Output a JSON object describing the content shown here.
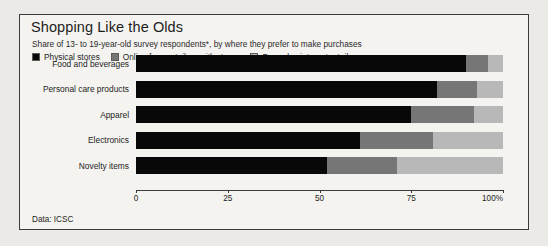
{
  "figure": {
    "title": "Shopping Like the Olds",
    "subtitle": "Share of 13- to 19-year-old survey respondents*, by where they prefer to make purchases",
    "source_note": "Data: ICSC",
    "colors": {
      "series_physical": "#080808",
      "series_online_retailers": "#767676",
      "series_pure_play": "#b8b8b8",
      "background": "#f4f3f0",
      "border": "#3a3a3a",
      "text": "#1d1d1d"
    }
  },
  "chart_data": {
    "type": "bar",
    "orientation": "horizontal",
    "stacked": true,
    "stack_total": 100,
    "title": "Shopping Like the Olds",
    "subtitle": "Share of 13- to 19-year-old survey respondents*, by where they prefer to make purchases",
    "xlabel": "",
    "ylabel": "",
    "xlim": [
      0,
      100
    ],
    "xticks": [
      0,
      25,
      50,
      75,
      100
    ],
    "xtick_labels": [
      "0",
      "25",
      "50",
      "75",
      "100%"
    ],
    "grid": false,
    "legend_position": "top-left",
    "categories": [
      "Food and beverages",
      "Personal care products",
      "Apparel",
      "Electronics",
      "Novelty items"
    ],
    "series": [
      {
        "name": "Physical stores",
        "color": "#080808",
        "values": [
          90,
          82,
          75,
          61,
          52
        ]
      },
      {
        "name": "Online from retailers with stores",
        "color": "#767676",
        "values": [
          6,
          11,
          17,
          20,
          19
        ]
      },
      {
        "name": "Pure-play internet retailers",
        "color": "#b8b8b8",
        "values": [
          4,
          7,
          8,
          19,
          29
        ]
      }
    ],
    "source": "Data: ICSC"
  }
}
